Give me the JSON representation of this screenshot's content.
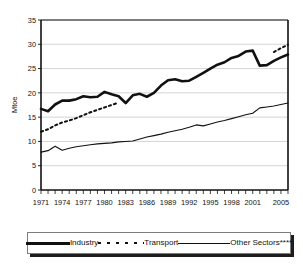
{
  "chart_data": {
    "type": "line",
    "title": "",
    "xlabel": "",
    "ylabel": "Mtoe",
    "ylim": [
      0,
      35
    ],
    "xlim": [
      1971,
      2006
    ],
    "yticks": [
      0,
      5,
      10,
      15,
      20,
      25,
      30,
      35
    ],
    "xticks": [
      1971,
      1974,
      1977,
      1980,
      1983,
      1986,
      1989,
      1992,
      1995,
      1998,
      2001,
      2005
    ],
    "grid": "horizontal",
    "legend_position": "bottom",
    "x": [
      1971,
      1972,
      1973,
      1974,
      1975,
      1976,
      1977,
      1978,
      1979,
      1980,
      1981,
      1982,
      1983,
      1984,
      1985,
      1986,
      1987,
      1988,
      1989,
      1990,
      1991,
      1992,
      1993,
      1994,
      1995,
      1996,
      1997,
      1998,
      1999,
      2000,
      2001,
      2002,
      2003,
      2004,
      2005,
      2006
    ],
    "series": [
      {
        "name": "Industry",
        "style": "thick-solid",
        "color": "#111111",
        "values": [
          16.7,
          16.2,
          17.6,
          18.4,
          18.4,
          18.7,
          19.3,
          19.1,
          19.2,
          20.2,
          19.7,
          19.3,
          17.9,
          19.5,
          19.8,
          19.2,
          20.0,
          21.5,
          22.6,
          22.8,
          22.4,
          22.5,
          23.3,
          24.1,
          25.0,
          25.8,
          26.3,
          27.2,
          27.6,
          28.5,
          28.7,
          25.6,
          25.7,
          26.6,
          27.3,
          27.9
        ]
      },
      {
        "name": "Transport",
        "style": "dotted",
        "color": "#111111",
        "values": [
          12.0,
          12.5,
          13.3,
          13.9,
          14.3,
          14.8,
          15.4,
          16.0,
          16.5,
          17.0,
          17.5,
          18.0,
          null,
          null,
          null,
          null,
          null,
          null,
          null,
          null,
          null,
          null,
          null,
          null,
          null,
          null,
          null,
          null,
          null,
          null,
          null,
          null,
          null,
          28.4,
          29.2,
          29.9
        ]
      },
      {
        "name": "Other Sectors****",
        "style": "thin-solid",
        "color": "#111111",
        "values": [
          7.8,
          8.1,
          9.0,
          8.2,
          8.6,
          8.9,
          9.1,
          9.3,
          9.5,
          9.6,
          9.7,
          9.9,
          10.0,
          10.1,
          10.5,
          10.9,
          11.2,
          11.5,
          11.9,
          12.2,
          12.5,
          12.9,
          13.4,
          13.2,
          13.6,
          14.0,
          14.3,
          14.7,
          15.1,
          15.5,
          15.8,
          16.9,
          17.1,
          17.3,
          17.6,
          17.9
        ]
      }
    ]
  },
  "legend": {
    "items": [
      {
        "label": "Industry",
        "swatch": "thick-solid-line-swatch"
      },
      {
        "label": "Transport",
        "swatch": "dotted-line-swatch"
      },
      {
        "label": "Other Sectors****",
        "swatch": "thin-solid-line-swatch"
      }
    ]
  },
  "axes": {
    "y_label": "Mtoe",
    "y_tick_labels": [
      "35",
      "30",
      "25",
      "20",
      "15",
      "10",
      "5",
      "0"
    ],
    "x_tick_labels": [
      "1971",
      "1974",
      "1977",
      "1980",
      "1983",
      "1986",
      "1989",
      "1992",
      "1995",
      "1998",
      "2001",
      "2005"
    ]
  },
  "colors": {
    "line": "#111111",
    "grid": "#cfcfcf",
    "axis": "#111111",
    "background": "#ffffff"
  }
}
